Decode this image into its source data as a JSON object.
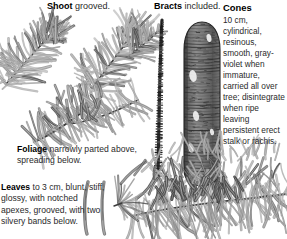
{
  "page": {
    "kind": "botanical-field-guide-plate",
    "background_color": "#ffffff",
    "ink_color": "#1a1a1a"
  },
  "labels": {
    "shoot": {
      "head": "Shoot",
      "body": "grooved."
    },
    "bracts": {
      "head": "Bracts",
      "body": "included."
    },
    "cones": {
      "head": "Cones",
      "body": "10 cm, cylindrical, resinous, smooth, gray-violet when immature, carried all over tree; disintegrate when ripe leaving persistent erect stalk or rachis."
    },
    "foliage": {
      "head": "Foliage",
      "body": "narrowly parted above, spreading below."
    },
    "leaves": {
      "head": "Leaves",
      "body": "to 3 cm, blunt, stiff, glossy, with notched apexes, grooved, with two silvery bands below."
    }
  },
  "figures": {
    "shoot_sprig_left": "fir-shoot-sprig-left",
    "shoot_sprig_right": "fir-shoot-sprig-right",
    "foliage_branch": "fir-foliage-branch",
    "rachis_spike": "cone-rachis-spike",
    "cone": "fir-cone",
    "needle_detail_1": "single-needle-detail",
    "needle_detail_2": "single-needle-detail",
    "needle_fan": "needle-fan-detail",
    "foliage_spray": "fir-foliage-spray"
  },
  "colors": {
    "ink": "#1a1a1a",
    "needle_mid": "#8d8d8d",
    "needle_dark": "#4a4a4a",
    "needle_light": "#bdbdbd",
    "stem": "#3b3b3b",
    "cone_body": "#7c7c7c",
    "cone_shadow": "#3a3a3a",
    "cone_highlight": "#e8e8e8"
  }
}
